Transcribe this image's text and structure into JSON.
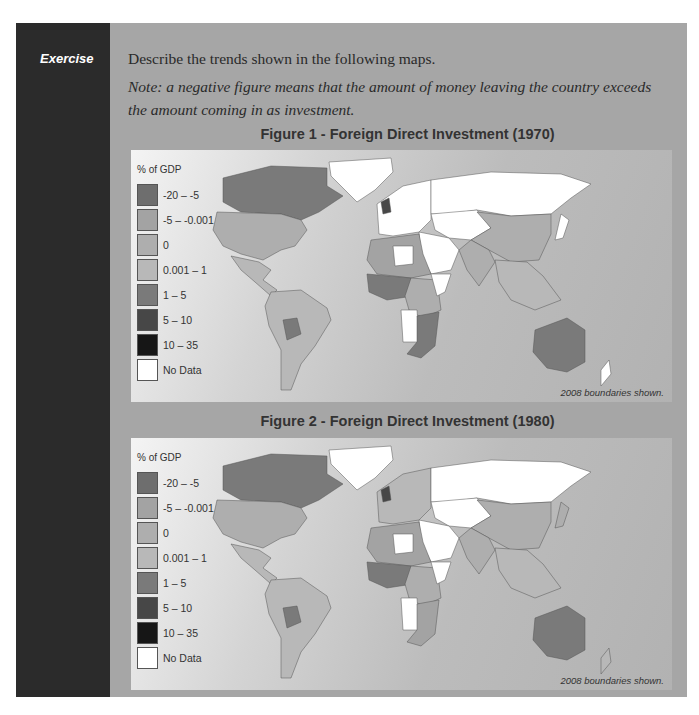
{
  "exercise": {
    "label": "Exercise",
    "instruction": "Describe the trends shown in the following maps.",
    "note": "Note: a negative figure means that the amount of money leaving the country exceeds the amount coming in as investment."
  },
  "legend": {
    "title": "% of GDP",
    "items": [
      {
        "label": "-20 – -5",
        "color": "#6e6e6e"
      },
      {
        "label": "-5 – -0.001",
        "color": "#a3a3a3"
      },
      {
        "label": "0",
        "color": "#aeaeae"
      },
      {
        "label": "0.001 – 1",
        "color": "#b8b8b8"
      },
      {
        "label": "1 – 5",
        "color": "#7a7a7a"
      },
      {
        "label": "5 – 10",
        "color": "#474747"
      },
      {
        "label": "10 – 35",
        "color": "#161616"
      },
      {
        "label": "No Data",
        "color": "#ffffff"
      }
    ]
  },
  "figures": [
    {
      "title": "Figure 1 - Foreign Direct Investment (1970)",
      "boundary_note": "2008 boundaries shown.",
      "regions": {
        "canada": "#7a7a7a",
        "usa": "#aeaeae",
        "greenland": "#ffffff",
        "central_america": "#b8b8b8",
        "south_america": "#b8b8b8",
        "bolivia": "#7a7a7a",
        "europe_west": "#ffffff",
        "uk": "#474747",
        "russia": "#ffffff",
        "central_asia": "#ffffff",
        "middle_east": "#ffffff",
        "north_africa": "#a3a3a3",
        "libya": "#ffffff",
        "west_africa": "#7a7a7a",
        "central_africa": "#aeaeae",
        "horn_africa": "#ffffff",
        "southern_africa": "#7a7a7a",
        "angola": "#ffffff",
        "china": "#aeaeae",
        "india": "#aeaeae",
        "se_asia": "#b8b8b8",
        "japan": "#ffffff",
        "australia": "#7a7a7a",
        "new_zealand": "#ffffff"
      }
    },
    {
      "title": "Figure 2 - Foreign Direct Investment (1980)",
      "boundary_note": "2008 boundaries shown.",
      "regions": {
        "canada": "#7a7a7a",
        "usa": "#aeaeae",
        "greenland": "#ffffff",
        "central_america": "#b8b8b8",
        "south_america": "#b8b8b8",
        "bolivia": "#7a7a7a",
        "europe_west": "#b8b8b8",
        "uk": "#474747",
        "russia": "#ffffff",
        "central_asia": "#ffffff",
        "middle_east": "#ffffff",
        "north_africa": "#a3a3a3",
        "libya": "#ffffff",
        "west_africa": "#7a7a7a",
        "central_africa": "#aeaeae",
        "horn_africa": "#ffffff",
        "southern_africa": "#a3a3a3",
        "angola": "#ffffff",
        "china": "#aeaeae",
        "india": "#aeaeae",
        "se_asia": "#b8b8b8",
        "japan": "#aeaeae",
        "australia": "#7a7a7a",
        "new_zealand": "#b8b8b8"
      }
    }
  ]
}
